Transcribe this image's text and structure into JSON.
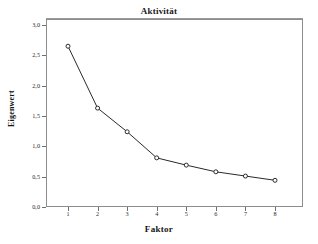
{
  "chart_data": {
    "type": "line",
    "title": "Aktivität",
    "xlabel": "Faktor",
    "ylabel": "Eigenwert",
    "x": [
      1,
      2,
      3,
      4,
      5,
      6,
      7,
      8
    ],
    "values": [
      2.65,
      1.63,
      1.24,
      0.81,
      0.69,
      0.58,
      0.51,
      0.44
    ],
    "series": [
      {
        "name": "Eigenwert",
        "values": [
          2.65,
          1.63,
          1.24,
          0.81,
          0.69,
          0.58,
          0.51,
          0.44
        ]
      }
    ],
    "xtick_labels": [
      "1",
      "2",
      "3",
      "4",
      "5",
      "6",
      "7",
      "8"
    ],
    "ytick_labels": [
      "0,0",
      "0,5",
      "1,0",
      "1,5",
      "2,0",
      "2,5",
      "3,0"
    ],
    "ytick_values": [
      0.0,
      0.5,
      1.0,
      1.5,
      2.0,
      2.5,
      3.0
    ],
    "ylim": [
      0.0,
      3.0
    ],
    "xlim": [
      0.5,
      8.5
    ],
    "grid": false,
    "legend": "none",
    "marker": "circle-open",
    "line_color": "#2a2a2a",
    "marker_fill": "#ffffff",
    "frame_color": "#8d8d8d",
    "background": "#ffffff"
  }
}
